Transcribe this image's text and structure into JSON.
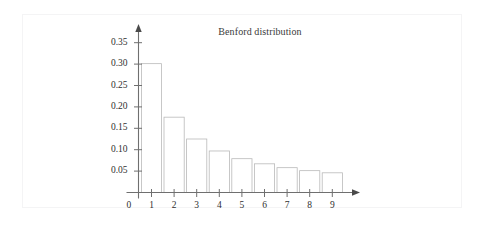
{
  "chart_data": {
    "type": "bar",
    "title": "Benford distribution",
    "xlabel": "",
    "ylabel": "",
    "categories": [
      "1",
      "2",
      "3",
      "4",
      "5",
      "6",
      "7",
      "8",
      "9"
    ],
    "values": [
      0.301,
      0.176,
      0.125,
      0.097,
      0.079,
      0.067,
      0.058,
      0.051,
      0.046
    ],
    "ylim": [
      0,
      0.375
    ],
    "xlim": [
      0,
      10
    ],
    "ytick_labels": [
      "0.05",
      "0.10",
      "0.15",
      "0.20",
      "0.25",
      "0.30",
      "0.35"
    ],
    "ytick_values": [
      0.05,
      0.1,
      0.15,
      0.2,
      0.25,
      0.3,
      0.35
    ],
    "xtick_labels": [
      "1",
      "2",
      "3",
      "4",
      "5",
      "6",
      "7",
      "8",
      "9"
    ],
    "origin_label": "0",
    "grid": false,
    "legend": null,
    "bar_fill": "#ffffff",
    "bar_stroke": "#b9b9b9",
    "axis_color": "#6f6f6f",
    "text_color": "#2f2f2f",
    "background": "#ffffff",
    "panel_border": "#f4f4f5",
    "y_axis_arrow": true,
    "x_axis_arrow": true
  }
}
